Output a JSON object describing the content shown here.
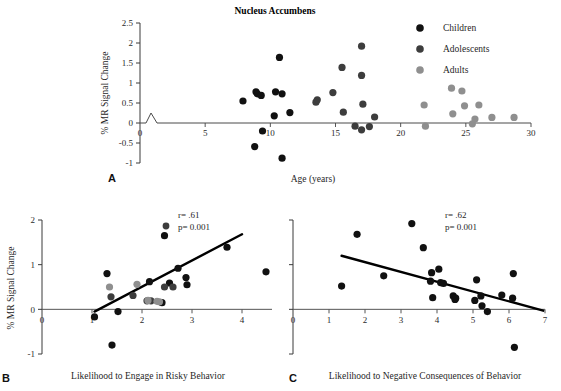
{
  "figure": {
    "panel_letters": {
      "a": "A",
      "b": "B",
      "c": "C"
    }
  },
  "chart_data": [
    {
      "id": "panel_a",
      "type": "scatter",
      "title": "Nucleus Accumbens",
      "xlabel": "Age (years)",
      "ylabel": "% MR Signal Change",
      "xlim": [
        0,
        30
      ],
      "ylim": [
        -1,
        2.5
      ],
      "xticks": [
        0,
        5,
        10,
        15,
        20,
        25,
        30
      ],
      "xtick_labels": [
        "0",
        "5",
        "10",
        "15",
        "20",
        "25",
        "30"
      ],
      "yticks": [
        -1,
        -0.5,
        0,
        0.5,
        1,
        1.5,
        2,
        2.5
      ],
      "ytick_labels": [
        "-1",
        "-0.5",
        "0",
        "0.5",
        "1",
        "1.5",
        "2",
        "2.5"
      ],
      "grid": false,
      "axis_break": true,
      "legend_position": "top-right",
      "legend": [
        {
          "name": "Children",
          "color": "#111111"
        },
        {
          "name": "Adolescents",
          "color": "#3d3d3d"
        },
        {
          "name": "Adults",
          "color": "#8f8f8f"
        }
      ],
      "series": [
        {
          "name": "Children",
          "color": "#111111",
          "points": [
            [
              7.9,
              0.55
            ],
            [
              8.9,
              0.78
            ],
            [
              9.0,
              0.73
            ],
            [
              9.3,
              0.69
            ],
            [
              9.4,
              -0.2
            ],
            [
              8.8,
              -0.59
            ],
            [
              10.3,
              0.18
            ],
            [
              10.4,
              0.78
            ],
            [
              10.7,
              1.64
            ],
            [
              10.9,
              0.73
            ],
            [
              10.9,
              -0.88
            ],
            [
              11.5,
              0.26
            ]
          ]
        },
        {
          "name": "Adolescents",
          "color": "#3d3d3d",
          "points": [
            [
              13.5,
              0.52
            ],
            [
              13.6,
              0.58
            ],
            [
              14.8,
              0.76
            ],
            [
              15.5,
              1.39
            ],
            [
              15.6,
              0.27
            ],
            [
              16.5,
              -0.08
            ],
            [
              17.0,
              1.92
            ],
            [
              17.0,
              1.19
            ],
            [
              17.0,
              -0.17
            ],
            [
              17.1,
              0.47
            ],
            [
              17.6,
              -0.09
            ],
            [
              18.0,
              0.15
            ]
          ]
        },
        {
          "name": "Adults",
          "color": "#8f8f8f",
          "points": [
            [
              21.8,
              0.45
            ],
            [
              21.9,
              -0.08
            ],
            [
              23.9,
              0.87
            ],
            [
              24.0,
              0.23
            ],
            [
              24.7,
              0.8
            ],
            [
              24.9,
              0.43
            ],
            [
              25.5,
              -0.02
            ],
            [
              25.7,
              0.1
            ],
            [
              26.0,
              0.45
            ],
            [
              27.0,
              0.14
            ],
            [
              28.7,
              0.14
            ]
          ]
        }
      ]
    },
    {
      "id": "panel_b",
      "type": "scatter",
      "title": "",
      "xlabel": "Likelihood to Engage in Risky Behavior",
      "ylabel": "% MR Signal Change",
      "xlim": [
        0,
        4.6
      ],
      "ylim": [
        -1,
        2
      ],
      "xticks": [
        0,
        1,
        2,
        3,
        4
      ],
      "xtick_labels": [
        "0",
        "1",
        "2",
        "3",
        "4"
      ],
      "yticks": [
        -1,
        0,
        1,
        2
      ],
      "ytick_labels": [
        "-1",
        "0",
        "1",
        "2"
      ],
      "grid": false,
      "annotations": {
        "r": "r= .61",
        "p": "p= 0.001"
      },
      "trend_line": {
        "x0": 1.05,
        "y0": -0.05,
        "x1": 4.0,
        "y1": 1.68
      },
      "series": [
        {
          "name": "Children",
          "color": "#111111",
          "points": [
            [
              1.05,
              -0.17
            ],
            [
              1.3,
              0.8
            ],
            [
              1.4,
              -0.8
            ],
            [
              1.52,
              -0.05
            ],
            [
              2.15,
              0.62
            ],
            [
              2.4,
              0.15
            ],
            [
              2.45,
              1.65
            ],
            [
              2.55,
              0.59
            ],
            [
              2.72,
              0.92
            ],
            [
              2.88,
              0.71
            ],
            [
              2.9,
              0.55
            ],
            [
              3.7,
              1.39
            ],
            [
              4.48,
              0.84
            ]
          ]
        },
        {
          "name": "Adolescents",
          "color": "#3d3d3d",
          "points": [
            [
              1.38,
              0.28
            ],
            [
              1.82,
              0.31
            ],
            [
              2.1,
              0.19
            ],
            [
              2.18,
              0.19
            ],
            [
              2.45,
              0.5
            ],
            [
              2.62,
              0.5
            ]
          ]
        },
        {
          "name": "Adults",
          "color": "#8f8f8f",
          "points": [
            [
              1.35,
              0.5
            ],
            [
              1.9,
              0.56
            ],
            [
              2.12,
              0.2
            ],
            [
              2.3,
              0.18
            ],
            [
              2.35,
              0.17
            ]
          ]
        }
      ]
    },
    {
      "id": "panel_c",
      "type": "scatter",
      "title": "",
      "xlabel": "Likelihood to Negative Consequences of Behavior",
      "ylabel": "",
      "xlim": [
        0,
        7
      ],
      "ylim": [
        -1,
        2
      ],
      "xticks": [
        0,
        1,
        2,
        3,
        4,
        5,
        6,
        7
      ],
      "xtick_labels": [
        "0",
        "1",
        "2",
        "3",
        "4",
        "5",
        "6",
        "7"
      ],
      "yticks": [
        -1,
        0,
        1,
        2
      ],
      "ytick_labels": [
        "-1",
        "0",
        "1",
        "2"
      ],
      "grid": false,
      "annotations": {
        "r": "r= .62",
        "p": "p= 0.001"
      },
      "trend_line": {
        "x0": 1.35,
        "y0": 1.2,
        "x1": 6.95,
        "y1": -0.03
      },
      "series": [
        {
          "name": "Children",
          "color": "#111111",
          "points": [
            [
              1.35,
              0.52
            ],
            [
              1.78,
              1.68
            ],
            [
              2.52,
              0.75
            ],
            [
              3.3,
              1.92
            ],
            [
              3.62,
              1.38
            ],
            [
              3.82,
              0.63
            ],
            [
              3.85,
              0.82
            ],
            [
              3.88,
              0.26
            ],
            [
              4.05,
              0.9
            ],
            [
              4.1,
              0.6
            ],
            [
              4.18,
              0.58
            ],
            [
              4.45,
              0.3
            ],
            [
              4.5,
              0.22
            ],
            [
              4.52,
              0.25
            ],
            [
              5.05,
              0.2
            ],
            [
              5.1,
              0.66
            ],
            [
              5.22,
              0.3
            ],
            [
              5.25,
              0.08
            ],
            [
              5.4,
              -0.05
            ],
            [
              5.8,
              0.32
            ],
            [
              6.1,
              0.25
            ],
            [
              6.12,
              0.8
            ],
            [
              6.15,
              -0.85
            ]
          ]
        }
      ]
    }
  ]
}
